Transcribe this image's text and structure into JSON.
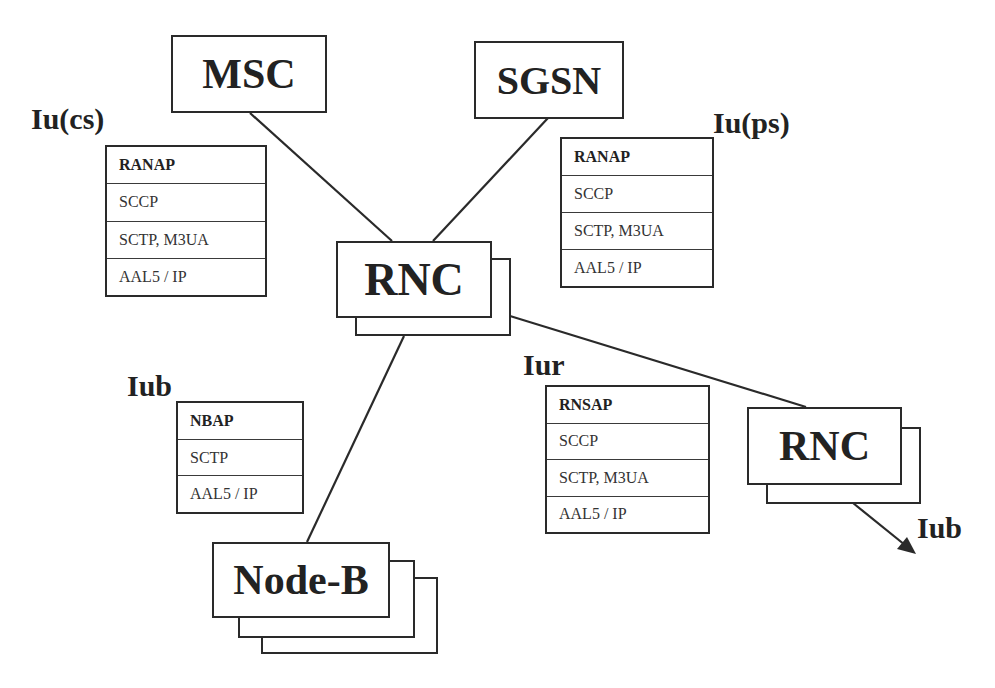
{
  "diagram": {
    "nodes": {
      "msc": "MSC",
      "sgsn": "SGSN",
      "rnc_main": "RNC",
      "rnc_remote": "RNC",
      "node_b": "Node-B"
    },
    "interfaces": {
      "iu_cs": {
        "label": "Iu(cs)",
        "stack": [
          "RANAP",
          "SCCP",
          "SCTP, M3UA",
          "AAL5 / IP"
        ]
      },
      "iu_ps": {
        "label": "Iu(ps)",
        "stack": [
          "RANAP",
          "SCCP",
          "SCTP, M3UA",
          "AAL5 / IP"
        ]
      },
      "iub": {
        "label": "Iub",
        "stack": [
          "NBAP",
          "SCTP",
          "AAL5 / IP"
        ]
      },
      "iur": {
        "label": "Iur",
        "stack": [
          "RNSAP",
          "SCCP",
          "SCTP, M3UA",
          "AAL5 / IP"
        ]
      },
      "iub_remote": {
        "label": "Iub"
      }
    },
    "connections": [
      {
        "from": "MSC",
        "to": "RNC"
      },
      {
        "from": "SGSN",
        "to": "RNC"
      },
      {
        "from": "RNC",
        "to": "RNC (remote)"
      },
      {
        "from": "RNC",
        "to": "Node-B"
      },
      {
        "from": "RNC (remote)",
        "to": "Iub",
        "arrow": true
      }
    ],
    "colors": {
      "line": "#2a2a2a",
      "text": "#222222",
      "background": "#ffffff"
    }
  }
}
